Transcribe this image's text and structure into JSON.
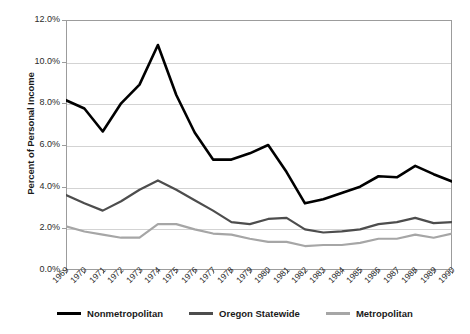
{
  "chart_data": {
    "type": "line",
    "title": "",
    "xlabel": "",
    "ylabel": "Percent of Personal Income",
    "ylim": [
      0,
      12
    ],
    "ytick_labels": [
      "12.0%",
      "10.0%",
      "8.0%",
      "6.0%",
      "4.0%",
      "2.0%",
      "0.0%"
    ],
    "ytick_values": [
      12,
      10,
      8,
      6,
      4,
      2,
      0
    ],
    "grid": true,
    "legend_position": "bottom",
    "categories": [
      "1969",
      "1970",
      "1971",
      "1972",
      "1973",
      "1974",
      "1975",
      "1976",
      "1977",
      "1978",
      "1979",
      "1980",
      "1981",
      "1982",
      "1983",
      "1984",
      "1985",
      "1986",
      "1987",
      "1988",
      "1989",
      "1990"
    ],
    "series": [
      {
        "name": "Nonmetropolitan",
        "color": "#000000",
        "width": 2.6,
        "values": [
          8.15,
          7.75,
          6.65,
          8.0,
          8.9,
          10.8,
          8.4,
          6.6,
          5.3,
          5.3,
          5.6,
          6.0,
          4.7,
          3.2,
          3.4,
          3.7,
          4.0,
          4.5,
          4.45,
          5.0,
          4.6,
          4.25
        ]
      },
      {
        "name": "Oregon Statewide",
        "color": "#4d4d4d",
        "width": 2.2,
        "values": [
          3.6,
          3.2,
          2.85,
          3.3,
          3.85,
          4.3,
          3.85,
          3.35,
          2.85,
          2.3,
          2.2,
          2.45,
          2.5,
          1.95,
          1.8,
          1.85,
          1.95,
          2.2,
          2.3,
          2.5,
          2.25,
          2.3
        ]
      },
      {
        "name": "Metropolitan",
        "color": "#a6a6a6",
        "width": 2.2,
        "values": [
          2.1,
          1.85,
          1.7,
          1.55,
          1.55,
          2.2,
          2.2,
          1.95,
          1.75,
          1.7,
          1.5,
          1.35,
          1.35,
          1.15,
          1.2,
          1.2,
          1.3,
          1.5,
          1.5,
          1.7,
          1.55,
          1.75
        ]
      }
    ]
  },
  "legend": {
    "entries": [
      {
        "label": "Nonmetropolitan",
        "color": "#000000",
        "width": 3
      },
      {
        "label": "Oregon Statewide",
        "color": "#4d4d4d",
        "width": 3
      },
      {
        "label": "Metropolitan",
        "color": "#a6a6a6",
        "width": 3
      }
    ]
  }
}
